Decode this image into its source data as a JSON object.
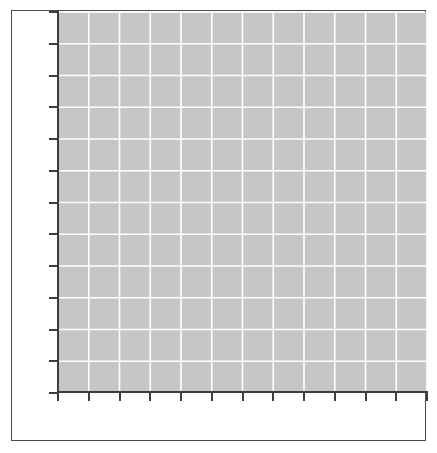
{
  "figure": {
    "width": 437,
    "height": 453,
    "background_color": "#ffffff",
    "frame_color": "#4a4a4a",
    "frame_visible": true
  },
  "chart_data": {
    "type": "line",
    "title": "",
    "subtitle": "",
    "xlabel": "",
    "ylabel": "",
    "series": [],
    "categories": [],
    "values": [],
    "annotations": [],
    "legend": {
      "visible": false,
      "position": "none",
      "entries": []
    },
    "grid": {
      "visible": true,
      "color": "#ffffff",
      "x_gridlines": 12,
      "y_gridlines": 12,
      "axis_facecolor": "#c6c6c6"
    },
    "xaxis": {
      "tick_labels": [],
      "tick_count": 13,
      "tick_direction": "out",
      "spine_color": "#3d3d3d",
      "xlim": [
        0,
        12
      ]
    },
    "yaxis": {
      "tick_labels": [],
      "tick_count": 13,
      "tick_direction": "out",
      "spine_color": "#3d3d3d",
      "ylim": [
        0,
        12
      ]
    },
    "note": "empty plot canvas, no plotted data series rendered"
  },
  "plot": {
    "area_color": "#c6c6c6",
    "gridline_color": "#ffffff",
    "x_tick_positions": [
      0,
      30.75,
      61.5,
      92.25,
      123,
      153.75,
      184.5,
      215.25,
      246,
      276.75,
      307.5,
      338.25,
      369
    ],
    "y_tick_positions": [
      0,
      31.75,
      63.5,
      95.25,
      127,
      158.75,
      190.5,
      222.25,
      254,
      285.75,
      317.5,
      349.25,
      381
    ]
  }
}
